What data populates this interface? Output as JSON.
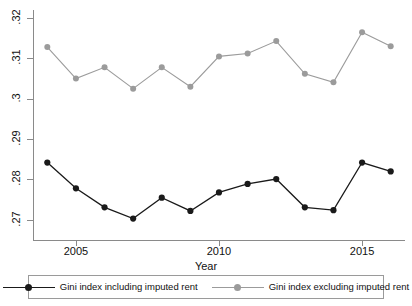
{
  "chart_data": {
    "type": "line",
    "title": "",
    "xlabel": "Year",
    "ylabel": "",
    "x": [
      2004,
      2005,
      2006,
      2007,
      2008,
      2009,
      2010,
      2011,
      2012,
      2013,
      2014,
      2015,
      2016
    ],
    "xlim": [
      2003.5,
      2016.5
    ],
    "ylim": [
      0.265,
      0.322
    ],
    "xticks": [
      2005,
      2010,
      2015
    ],
    "xticklabels": [
      "2005",
      "2010",
      "2015"
    ],
    "yticks": [
      0.27,
      0.28,
      0.29,
      0.3,
      0.31,
      0.32
    ],
    "yticklabels": [
      ".27",
      ".28",
      ".29",
      ".3",
      ".31",
      ".32"
    ],
    "grid": false,
    "legend_position": "bottom",
    "series": [
      {
        "name": "Gini index including imputed rent",
        "color": "#1a1a1a",
        "marker": "circle",
        "values": [
          0.2842,
          0.2778,
          0.2731,
          0.2703,
          0.2755,
          0.2722,
          0.2768,
          0.2789,
          0.2801,
          0.2731,
          0.2724,
          0.2842,
          0.282
        ]
      },
      {
        "name": "Gini index excluding imputed rent",
        "color": "#9b9b9b",
        "marker": "circle",
        "values": [
          0.3128,
          0.305,
          0.3078,
          0.3025,
          0.3078,
          0.303,
          0.3105,
          0.3112,
          0.3143,
          0.3062,
          0.3041,
          0.3165,
          0.313
        ]
      }
    ]
  },
  "axis": {
    "x_title": "Year"
  },
  "legend": {
    "entries": [
      {
        "label": "Gini index including imputed rent",
        "color": "#1a1a1a"
      },
      {
        "label": "Gini index excluding imputed rent",
        "color": "#9b9b9b"
      }
    ]
  }
}
